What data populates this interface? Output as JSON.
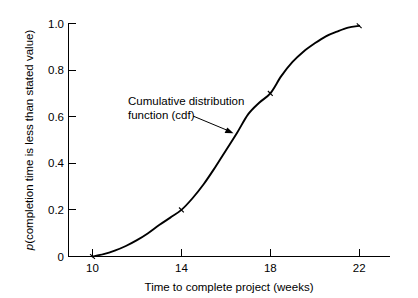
{
  "chart_data": {
    "type": "line",
    "title": "",
    "subtitle": "",
    "xlabel": "Time to complete project (weeks)",
    "ylabel": "p(completion time is less than stated value)",
    "ylabel_italic_prefix": "p",
    "ylabel_rest": "(completion time is less than stated value)",
    "xlim": [
      9.0,
      24.0
    ],
    "ylim": [
      0.0,
      1.0
    ],
    "xticks": [
      10,
      14,
      18,
      22
    ],
    "xtick_labels": [
      "10",
      "14",
      "18",
      "22"
    ],
    "yticks": [
      0,
      0.2,
      0.4,
      0.6,
      0.8,
      1.0
    ],
    "ytick_labels": [
      "0",
      "0.2",
      "0.4",
      "0.6",
      "0.8",
      "1.0"
    ],
    "grid": false,
    "legend": false,
    "legend_position": "none",
    "series": [
      {
        "name": "Cumulative distribution function (cdf)",
        "x": [
          10.0,
          10.5,
          11.0,
          11.5,
          12.0,
          12.5,
          13.0,
          13.5,
          14.0,
          14.5,
          15.0,
          15.5,
          16.0,
          16.5,
          17.0,
          17.5,
          18.0,
          18.5,
          19.0,
          19.5,
          20.0,
          20.5,
          21.0,
          21.5,
          22.0
        ],
        "y": [
          0.0,
          0.01,
          0.025,
          0.045,
          0.07,
          0.1,
          0.135,
          0.167,
          0.2,
          0.25,
          0.31,
          0.38,
          0.455,
          0.53,
          0.61,
          0.66,
          0.7,
          0.775,
          0.835,
          0.88,
          0.915,
          0.945,
          0.965,
          0.982,
          0.99
        ],
        "markers": [
          {
            "x": 10,
            "y": 0.0
          },
          {
            "x": 14,
            "y": 0.2
          },
          {
            "x": 18,
            "y": 0.7
          },
          {
            "x": 22,
            "y": 0.99
          }
        ]
      }
    ],
    "annotations": [
      {
        "name": "cdf-annotation",
        "line1": "Cumulative distribution",
        "line2": "function (cdf)",
        "text_x": 16.0,
        "text_y": 0.58,
        "points_to_x": 16.3,
        "points_to_y": 0.525
      }
    ],
    "colors": {
      "curve": "#000000",
      "axis": "#000000",
      "text": "#000000",
      "background": "#ffffff"
    }
  }
}
